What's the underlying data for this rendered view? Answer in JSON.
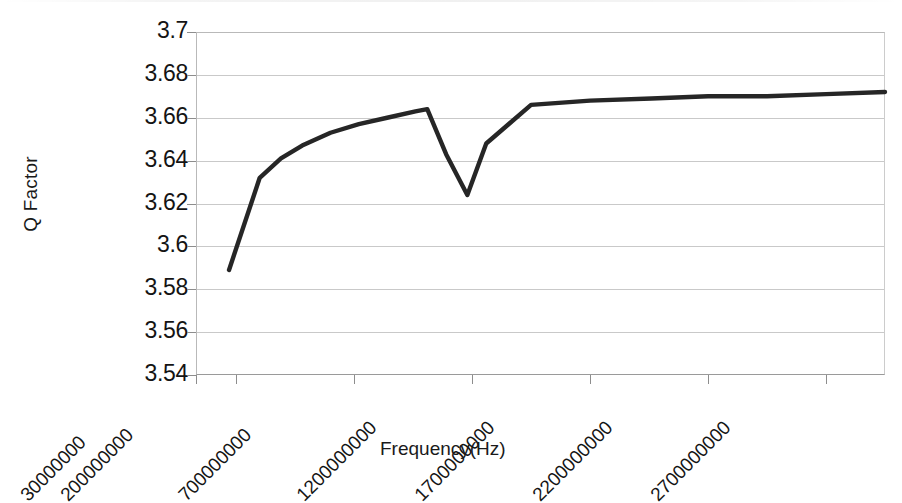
{
  "chart_data": {
    "type": "line",
    "title": "",
    "xlabel": "Frequency(Hz)",
    "ylabel": "Q Factor",
    "grid": true,
    "legend": "none",
    "ylim": [
      3.54,
      3.7
    ],
    "ytick_labels": [
      "3.7",
      "3.68",
      "3.66",
      "3.64",
      "3.62",
      "3.6",
      "3.58",
      "3.56",
      "3.54"
    ],
    "ytick_values": [
      3.7,
      3.68,
      3.66,
      3.64,
      3.62,
      3.6,
      3.58,
      3.56,
      3.54
    ],
    "xtick_labels": [
      "30000000",
      "200000000",
      "700000000",
      "1200000000",
      "1700000000",
      "2200000000",
      "2700000000"
    ],
    "xtick_values": [
      30000000,
      200000000,
      700000000,
      1200000000,
      1700000000,
      2200000000,
      2700000000
    ],
    "xlim": [
      30000000,
      2950000000
    ],
    "series": [
      {
        "name": "Q Factor",
        "color": "#262626",
        "x": [
          170000000,
          300000000,
          390000000,
          480000000,
          600000000,
          720000000,
          840000000,
          960000000,
          1010000000,
          1090000000,
          1180000000,
          1260000000,
          1450000000,
          1700000000,
          1960000000,
          2200000000,
          2450000000,
          2700000000,
          2950000000
        ],
        "y": [
          3.589,
          3.632,
          3.641,
          3.647,
          3.653,
          3.657,
          3.66,
          3.663,
          3.664,
          3.643,
          3.624,
          3.648,
          3.666,
          3.668,
          3.669,
          3.67,
          3.67,
          3.671,
          3.672
        ]
      }
    ],
    "annotations": [
      "Sharp narrow notch (dip) in Q factor to a minimum of about 3.624 near 1.18 GHz",
      "Curve rises steeply from 3.589 at the low-frequency end and flattens near 3.67 above 1.5 GHz"
    ]
  },
  "axes": {
    "y_title": "Q Factor",
    "x_title": "Frequency(Hz)"
  }
}
